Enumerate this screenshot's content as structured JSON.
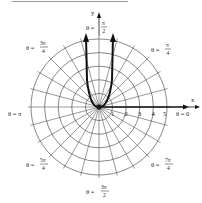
{
  "figure": {
    "type": "polar-graph",
    "center": {
      "x": 99,
      "y": 107
    },
    "unit_px": 13.6,
    "circles": [
      1,
      2,
      3,
      4,
      5
    ],
    "radial_step_deg": 15,
    "axis_labels": {
      "x": "x",
      "y": "y"
    },
    "r_ticks": [
      "1",
      "2",
      "3",
      "4",
      "5"
    ],
    "angle_labels": [
      {
        "id": "theta-0",
        "text": "θ = 0",
        "num": "",
        "den": ""
      },
      {
        "id": "theta-pi-4",
        "prefix": "θ = ",
        "num": "π",
        "den": "4"
      },
      {
        "id": "theta-pi-2",
        "prefix": "θ = ",
        "num": "π",
        "den": "2"
      },
      {
        "id": "theta-3pi-4",
        "prefix": "θ = ",
        "num": "3π",
        "den": "4"
      },
      {
        "id": "theta-pi",
        "text": "θ = π",
        "num": "",
        "den": ""
      },
      {
        "id": "theta-5pi-4",
        "prefix": "θ = ",
        "num": "5π",
        "den": "4"
      },
      {
        "id": "theta-3pi-2",
        "prefix": "θ = ",
        "num": "3π",
        "den": "2"
      },
      {
        "id": "theta-7pi-4",
        "prefix": "θ = ",
        "num": "7π",
        "den": "4"
      }
    ],
    "curve": {
      "description": "U-shaped curve through pole opening upward, arrows at both ends",
      "color": "#111111"
    },
    "colors": {
      "grid": "#555555",
      "curve": "#111111",
      "axis": "#111111"
    }
  }
}
